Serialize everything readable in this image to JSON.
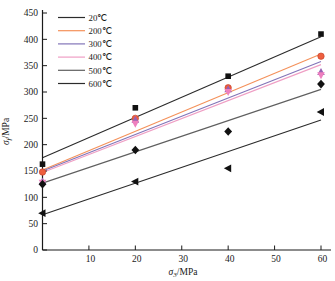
{
  "chart_data": {
    "type": "scatter",
    "xlabel_sigma": "σ",
    "xlabel_sub": "3",
    "xlabel_rest": "/MPa",
    "ylabel_sigma": "σ",
    "ylabel_sub": "f",
    "ylabel_rest": "/MPa",
    "xlim": [
      0,
      60
    ],
    "ylim": [
      0,
      450
    ],
    "xticks": [
      10,
      20,
      30,
      40,
      50,
      60
    ],
    "yticks": [
      0,
      50,
      100,
      150,
      200,
      250,
      300,
      350,
      400,
      450
    ],
    "grid": false,
    "legend_position": "top-left",
    "axis_color": "#1a1a1a",
    "series": [
      {
        "name": "20℃",
        "color": "#2b2b2b",
        "marker": "square",
        "marker_color": "#111111",
        "points": [
          [
            0,
            163
          ],
          [
            20,
            270
          ],
          [
            40,
            330
          ],
          [
            60,
            410
          ]
        ],
        "fit_line_y_at_x0_x60": [
          175,
          405
        ]
      },
      {
        "name": "200℃",
        "color": "#f4915a",
        "marker": "circle",
        "marker_color": "#ee5f3f",
        "points": [
          [
            0,
            148
          ],
          [
            20,
            250
          ],
          [
            40,
            308
          ],
          [
            60,
            368
          ]
        ],
        "fit_line_y_at_x0_x60": [
          152,
          372
        ]
      },
      {
        "name": "300℃",
        "color": "#8274b8",
        "marker": "triangle-up",
        "marker_color": "#9760b3",
        "points": [
          [
            0,
            130
          ],
          [
            20,
            247
          ],
          [
            40,
            305
          ],
          [
            60,
            338
          ]
        ],
        "fit_line_y_at_x0_x60": [
          150,
          358
        ]
      },
      {
        "name": "400℃",
        "color": "#ef9ec4",
        "marker": "triangle-down",
        "marker_color": "#ee7fbe",
        "points": [
          [
            0,
            128
          ],
          [
            20,
            240
          ],
          [
            40,
            300
          ],
          [
            60,
            332
          ]
        ],
        "fit_line_y_at_x0_x60": [
          147,
          352
        ]
      },
      {
        "name": "500℃",
        "color": "#5f5f5f",
        "marker": "diamond",
        "marker_color": "#111111",
        "points": [
          [
            0,
            125
          ],
          [
            20,
            190
          ],
          [
            40,
            225
          ],
          [
            60,
            315
          ]
        ],
        "fit_line_y_at_x0_x60": [
          127,
          305
        ]
      },
      {
        "name": "600℃",
        "color": "#2b2b2b",
        "marker": "triangle-left",
        "marker_color": "#111111",
        "points": [
          [
            0,
            70
          ],
          [
            20,
            130
          ],
          [
            40,
            155
          ],
          [
            60,
            262
          ]
        ],
        "fit_line_y_at_x0_x60": [
          67,
          247
        ]
      }
    ]
  }
}
